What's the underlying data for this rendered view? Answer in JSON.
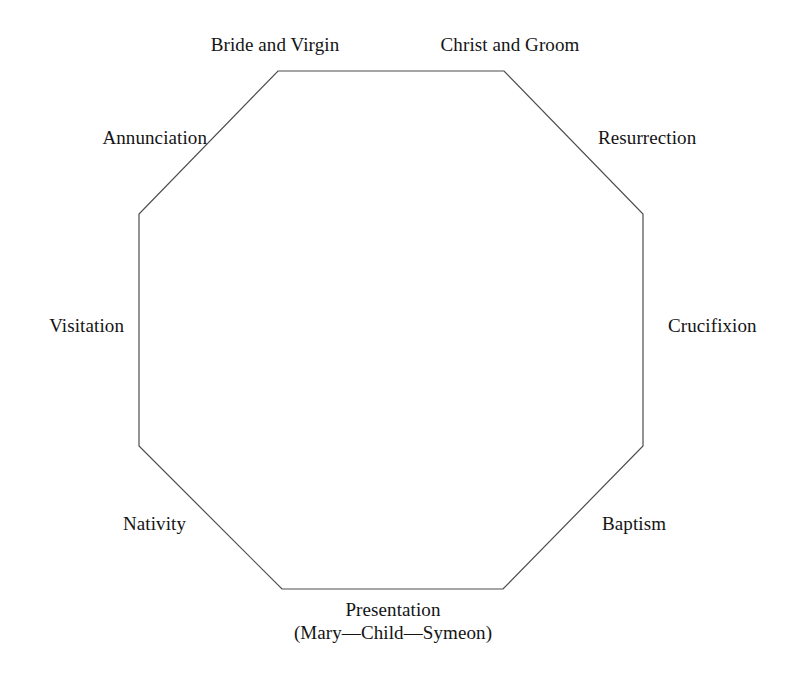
{
  "diagram": {
    "type": "octagon",
    "shape": {
      "stroke_color": "#4d4d4d",
      "fill_color": "#ffffff",
      "stroke_width": 1.2,
      "vertices": [
        {
          "x": 278,
          "y": 71
        },
        {
          "x": 504,
          "y": 71
        },
        {
          "x": 643,
          "y": 214
        },
        {
          "x": 643,
          "y": 446
        },
        {
          "x": 503,
          "y": 589
        },
        {
          "x": 282,
          "y": 589
        },
        {
          "x": 139,
          "y": 446
        },
        {
          "x": 139,
          "y": 214
        }
      ]
    },
    "nodes": [
      {
        "id": "bride-and-virgin",
        "label": "Bride and Virgin",
        "position": "top-left"
      },
      {
        "id": "christ-and-groom",
        "label": "Christ and Groom",
        "position": "top-right"
      },
      {
        "id": "annunciation",
        "label": "Annunciation",
        "position": "upper-left"
      },
      {
        "id": "resurrection",
        "label": "Resurrection",
        "position": "upper-right"
      },
      {
        "id": "visitation",
        "label": "Visitation",
        "position": "left"
      },
      {
        "id": "crucifixion",
        "label": "Crucifixion",
        "position": "right"
      },
      {
        "id": "nativity",
        "label": "Nativity",
        "position": "lower-left"
      },
      {
        "id": "baptism",
        "label": "Baptism",
        "position": "lower-right"
      },
      {
        "id": "presentation",
        "label": "Presentation",
        "sublabel": "(Mary—Child—Symeon)",
        "position": "bottom"
      }
    ]
  },
  "page": {
    "background_color": "#ffffff",
    "text_color": "#141414"
  }
}
